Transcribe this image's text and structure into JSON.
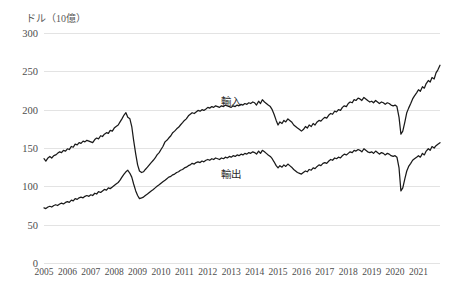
{
  "chart_data": {
    "type": "line",
    "title": "",
    "unit_label": "ドル（10億）",
    "xlabel": "",
    "ylabel": "",
    "ylim": [
      0,
      300
    ],
    "yticks": [
      0,
      50,
      100,
      150,
      200,
      250,
      300
    ],
    "xlim": [
      2005.0,
      2021.92
    ],
    "xticks": [
      2005,
      2006,
      2007,
      2008,
      2009,
      2010,
      2011,
      2012,
      2013,
      2014,
      2015,
      2016,
      2017,
      2018,
      2019,
      2020,
      2021
    ],
    "xtick_labels": [
      "2005",
      "2006",
      "2007",
      "2008",
      "2009",
      "2010",
      "2011",
      "2012",
      "2013",
      "2014",
      "2015",
      "2016",
      "2017",
      "2018",
      "2019",
      "2020",
      "2021"
    ],
    "grid": "horizontal",
    "legend_position": "inline-annotation",
    "annotations": [
      {
        "text": "輸入",
        "x": 2013.0,
        "y": 213
      },
      {
        "text": "輸出",
        "x": 2013.0,
        "y": 118
      }
    ],
    "series": [
      {
        "name": "輸入",
        "color": "#1a1a1a",
        "x": [
          2005.0,
          2005.08,
          2005.17,
          2005.25,
          2005.33,
          2005.42,
          2005.5,
          2005.58,
          2005.67,
          2005.75,
          2005.83,
          2005.92,
          2006.0,
          2006.08,
          2006.17,
          2006.25,
          2006.33,
          2006.42,
          2006.5,
          2006.58,
          2006.67,
          2006.75,
          2006.83,
          2006.92,
          2007.0,
          2007.08,
          2007.17,
          2007.25,
          2007.33,
          2007.42,
          2007.5,
          2007.58,
          2007.67,
          2007.75,
          2007.83,
          2007.92,
          2008.0,
          2008.08,
          2008.17,
          2008.25,
          2008.33,
          2008.42,
          2008.5,
          2008.58,
          2008.67,
          2008.75,
          2008.83,
          2008.92,
          2009.0,
          2009.08,
          2009.17,
          2009.25,
          2009.33,
          2009.42,
          2009.5,
          2009.58,
          2009.67,
          2009.75,
          2009.83,
          2009.92,
          2010.0,
          2010.08,
          2010.17,
          2010.25,
          2010.33,
          2010.42,
          2010.5,
          2010.58,
          2010.67,
          2010.75,
          2010.83,
          2010.92,
          2011.0,
          2011.08,
          2011.17,
          2011.25,
          2011.33,
          2011.42,
          2011.5,
          2011.58,
          2011.67,
          2011.75,
          2011.83,
          2011.92,
          2012.0,
          2012.08,
          2012.17,
          2012.25,
          2012.33,
          2012.42,
          2012.5,
          2012.58,
          2012.67,
          2012.75,
          2012.83,
          2012.92,
          2013.0,
          2013.08,
          2013.17,
          2013.25,
          2013.33,
          2013.42,
          2013.5,
          2013.58,
          2013.67,
          2013.75,
          2013.83,
          2013.92,
          2014.0,
          2014.08,
          2014.17,
          2014.25,
          2014.33,
          2014.42,
          2014.5,
          2014.58,
          2014.67,
          2014.75,
          2014.83,
          2014.92,
          2015.0,
          2015.08,
          2015.17,
          2015.25,
          2015.33,
          2015.42,
          2015.5,
          2015.58,
          2015.67,
          2015.75,
          2015.83,
          2015.92,
          2016.0,
          2016.08,
          2016.17,
          2016.25,
          2016.33,
          2016.42,
          2016.5,
          2016.58,
          2016.67,
          2016.75,
          2016.83,
          2016.92,
          2017.0,
          2017.08,
          2017.17,
          2017.25,
          2017.33,
          2017.42,
          2017.5,
          2017.58,
          2017.67,
          2017.75,
          2017.83,
          2017.92,
          2018.0,
          2018.08,
          2018.17,
          2018.25,
          2018.33,
          2018.42,
          2018.5,
          2018.58,
          2018.67,
          2018.75,
          2018.83,
          2018.92,
          2019.0,
          2019.08,
          2019.17,
          2019.25,
          2019.33,
          2019.42,
          2019.5,
          2019.58,
          2019.67,
          2019.75,
          2019.83,
          2019.92,
          2020.0,
          2020.08,
          2020.17,
          2020.25,
          2020.33,
          2020.42,
          2020.5,
          2020.58,
          2020.67,
          2020.75,
          2020.83,
          2020.92,
          2021.0,
          2021.08,
          2021.17,
          2021.25,
          2021.33,
          2021.42,
          2021.5,
          2021.58,
          2021.67,
          2021.75,
          2021.83,
          2021.92
        ],
        "values": [
          136,
          133,
          137,
          139,
          137,
          140,
          141,
          143,
          145,
          144,
          147,
          146,
          149,
          148,
          152,
          151,
          155,
          154,
          157,
          156,
          159,
          158,
          160,
          159,
          158,
          157,
          161,
          163,
          162,
          166,
          165,
          168,
          170,
          169,
          173,
          172,
          176,
          178,
          180,
          184,
          188,
          193,
          196,
          190,
          188,
          178,
          160,
          142,
          128,
          120,
          118,
          119,
          122,
          125,
          128,
          131,
          134,
          137,
          141,
          144,
          148,
          152,
          158,
          160,
          163,
          166,
          170,
          172,
          175,
          177,
          180,
          183,
          186,
          188,
          192,
          194,
          196,
          195,
          197,
          199,
          198,
          200,
          199,
          201,
          203,
          202,
          204,
          203,
          205,
          204,
          203,
          205,
          204,
          206,
          205,
          204,
          203,
          205,
          204,
          206,
          205,
          207,
          206,
          208,
          207,
          209,
          208,
          210,
          209,
          206,
          211,
          208,
          213,
          210,
          208,
          206,
          204,
          200,
          194,
          186,
          180,
          184,
          182,
          186,
          184,
          188,
          186,
          184,
          180,
          178,
          176,
          174,
          172,
          174,
          178,
          176,
          180,
          178,
          182,
          180,
          184,
          186,
          185,
          188,
          190,
          189,
          193,
          195,
          194,
          198,
          197,
          200,
          199,
          203,
          205,
          204,
          208,
          210,
          209,
          213,
          212,
          215,
          214,
          212,
          216,
          214,
          212,
          210,
          211,
          209,
          212,
          210,
          208,
          210,
          209,
          207,
          209,
          208,
          206,
          205,
          206,
          204,
          190,
          168,
          172,
          184,
          196,
          202,
          208,
          214,
          218,
          222,
          226,
          224,
          230,
          228,
          234,
          238,
          236,
          242,
          240,
          248,
          252,
          258
        ]
      },
      {
        "name": "輸出",
        "color": "#1a1a1a",
        "x": [
          2005.0,
          2005.08,
          2005.17,
          2005.25,
          2005.33,
          2005.42,
          2005.5,
          2005.58,
          2005.67,
          2005.75,
          2005.83,
          2005.92,
          2006.0,
          2006.08,
          2006.17,
          2006.25,
          2006.33,
          2006.42,
          2006.5,
          2006.58,
          2006.67,
          2006.75,
          2006.83,
          2006.92,
          2007.0,
          2007.08,
          2007.17,
          2007.25,
          2007.33,
          2007.42,
          2007.5,
          2007.58,
          2007.67,
          2007.75,
          2007.83,
          2007.92,
          2008.0,
          2008.08,
          2008.17,
          2008.25,
          2008.33,
          2008.42,
          2008.5,
          2008.58,
          2008.67,
          2008.75,
          2008.83,
          2008.92,
          2009.0,
          2009.08,
          2009.17,
          2009.25,
          2009.33,
          2009.42,
          2009.5,
          2009.58,
          2009.67,
          2009.75,
          2009.83,
          2009.92,
          2010.0,
          2010.08,
          2010.17,
          2010.25,
          2010.33,
          2010.42,
          2010.5,
          2010.58,
          2010.67,
          2010.75,
          2010.83,
          2010.92,
          2011.0,
          2011.08,
          2011.17,
          2011.25,
          2011.33,
          2011.42,
          2011.5,
          2011.58,
          2011.67,
          2011.75,
          2011.83,
          2011.92,
          2012.0,
          2012.08,
          2012.17,
          2012.25,
          2012.33,
          2012.42,
          2012.5,
          2012.58,
          2012.67,
          2012.75,
          2012.83,
          2012.92,
          2013.0,
          2013.08,
          2013.17,
          2013.25,
          2013.33,
          2013.42,
          2013.5,
          2013.58,
          2013.67,
          2013.75,
          2013.83,
          2013.92,
          2014.0,
          2014.08,
          2014.17,
          2014.25,
          2014.33,
          2014.42,
          2014.5,
          2014.58,
          2014.67,
          2014.75,
          2014.83,
          2014.92,
          2015.0,
          2015.08,
          2015.17,
          2015.25,
          2015.33,
          2015.42,
          2015.5,
          2015.58,
          2015.67,
          2015.75,
          2015.83,
          2015.92,
          2016.0,
          2016.08,
          2016.17,
          2016.25,
          2016.33,
          2016.42,
          2016.5,
          2016.58,
          2016.67,
          2016.75,
          2016.83,
          2016.92,
          2017.0,
          2017.08,
          2017.17,
          2017.25,
          2017.33,
          2017.42,
          2017.5,
          2017.58,
          2017.67,
          2017.75,
          2017.83,
          2017.92,
          2018.0,
          2018.08,
          2018.17,
          2018.25,
          2018.33,
          2018.42,
          2018.5,
          2018.58,
          2018.67,
          2018.75,
          2018.83,
          2018.92,
          2019.0,
          2019.08,
          2019.17,
          2019.25,
          2019.33,
          2019.42,
          2019.5,
          2019.58,
          2019.67,
          2019.75,
          2019.83,
          2019.92,
          2020.0,
          2020.08,
          2020.17,
          2020.25,
          2020.33,
          2020.42,
          2020.5,
          2020.58,
          2020.67,
          2020.75,
          2020.83,
          2020.92,
          2021.0,
          2021.08,
          2021.17,
          2021.25,
          2021.33,
          2021.42,
          2021.5,
          2021.58,
          2021.67,
          2021.75,
          2021.83,
          2021.92
        ],
        "values": [
          72,
          71,
          73,
          74,
          73,
          75,
          76,
          75,
          77,
          78,
          77,
          79,
          80,
          79,
          82,
          81,
          84,
          83,
          85,
          86,
          85,
          87,
          88,
          87,
          89,
          88,
          91,
          90,
          93,
          92,
          94,
          96,
          95,
          98,
          97,
          99,
          101,
          103,
          105,
          108,
          112,
          116,
          119,
          121,
          117,
          112,
          103,
          94,
          88,
          84,
          85,
          86,
          88,
          90,
          92,
          94,
          96,
          98,
          100,
          102,
          104,
          106,
          108,
          110,
          112,
          113,
          115,
          116,
          118,
          119,
          121,
          122,
          124,
          125,
          127,
          128,
          130,
          129,
          131,
          132,
          131,
          133,
          132,
          134,
          135,
          134,
          136,
          135,
          137,
          136,
          135,
          137,
          136,
          138,
          137,
          139,
          138,
          140,
          139,
          141,
          140,
          142,
          141,
          143,
          142,
          144,
          143,
          145,
          144,
          142,
          146,
          143,
          147,
          145,
          143,
          141,
          139,
          136,
          132,
          127,
          124,
          127,
          125,
          128,
          126,
          129,
          127,
          125,
          122,
          120,
          118,
          117,
          116,
          118,
          120,
          119,
          122,
          121,
          124,
          123,
          126,
          128,
          127,
          130,
          131,
          130,
          133,
          135,
          134,
          137,
          136,
          138,
          137,
          140,
          142,
          141,
          143,
          145,
          144,
          147,
          146,
          148,
          147,
          145,
          149,
          147,
          145,
          144,
          145,
          143,
          146,
          144,
          142,
          144,
          143,
          141,
          143,
          142,
          140,
          139,
          140,
          138,
          124,
          94,
          98,
          110,
          120,
          126,
          130,
          134,
          136,
          138,
          140,
          138,
          143,
          141,
          146,
          149,
          147,
          152,
          150,
          153,
          155,
          157
        ]
      }
    ]
  }
}
